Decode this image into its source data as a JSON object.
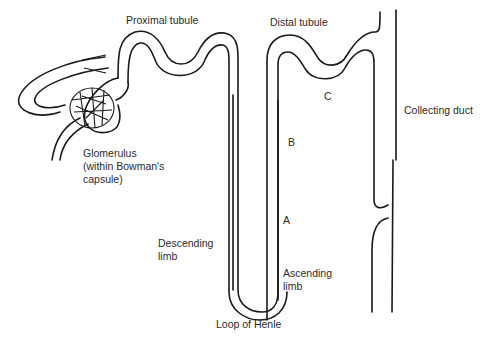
{
  "diagram": {
    "labels": {
      "proximal_tubule": "Proximal tubule",
      "distal_tubule": "Distal tubule",
      "collecting_duct": "Collecting duct",
      "glomerulus_line1": "Glomerulus",
      "glomerulus_line2": "(within Bowman's",
      "glomerulus_line3": "capsule)",
      "descending_line1": "Descending",
      "descending_line2": "limb",
      "ascending_line1": "Ascending",
      "ascending_line2": "limb",
      "loop_of_henle": "Loop of Henle",
      "marker_a": "A",
      "marker_b": "B",
      "marker_c": "C"
    },
    "colors": {
      "stroke": "#1a1a1a",
      "text": "#2a2a2a",
      "background": "#ffffff"
    }
  }
}
